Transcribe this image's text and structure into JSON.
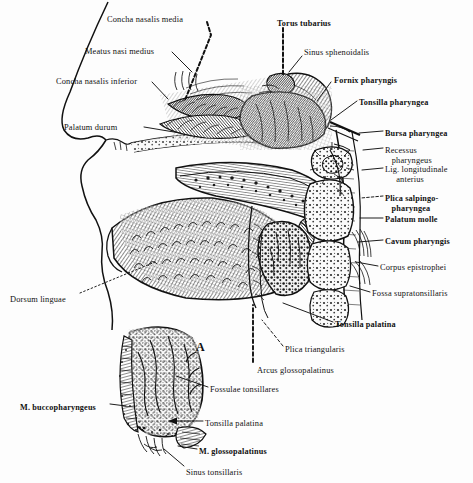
{
  "figure": {
    "background_color": "#fdfdfd",
    "ink_color": "#111111",
    "figure_letters": [
      {
        "text": "A",
        "x": 196,
        "y": 347
      }
    ]
  },
  "labels": [
    {
      "id": "concha-nasalis-media",
      "text": "Concha nasalis media",
      "x": 107,
      "y": 15,
      "bold": false
    },
    {
      "id": "torus-tubarius",
      "text": "Torus tubarius",
      "x": 277,
      "y": 19,
      "bold": true
    },
    {
      "id": "meatus-nasi-medius",
      "text": "Meatus nasi medius",
      "x": 85,
      "y": 47,
      "bold": false
    },
    {
      "id": "sinus-sphenoidalis",
      "text": "Sinus sphenoidalis",
      "x": 304,
      "y": 48,
      "bold": false
    },
    {
      "id": "concha-nasalis-inferior",
      "text": "Concha nasalis inferior",
      "x": 56,
      "y": 77,
      "bold": false
    },
    {
      "id": "fornix-pharyngis",
      "text": "Fornix pharyngis",
      "x": 334,
      "y": 76,
      "bold": true
    },
    {
      "id": "tonsilla-pharyngea",
      "text": "Tonsilla pharyngea",
      "x": 359,
      "y": 98,
      "bold": true
    },
    {
      "id": "palatum-durum",
      "text": "Palatum durum",
      "x": 64,
      "y": 123,
      "bold": false
    },
    {
      "id": "bursa-pharyngea",
      "text": "Bursa pharyngea",
      "x": 385,
      "y": 129,
      "bold": true
    },
    {
      "id": "recessus-pharyngeus",
      "text": "Recessus\n   pharyngeus",
      "x": 385,
      "y": 146,
      "bold": false
    },
    {
      "id": "lig-longitudinale",
      "text": "Lig. longitudinale\n     anterius",
      "x": 385,
      "y": 165,
      "bold": false
    },
    {
      "id": "plica-salpingopharyngea",
      "text": "Plica salpingo-\n   pharyngea",
      "x": 385,
      "y": 194,
      "bold": true
    },
    {
      "id": "palatum-molle",
      "text": "Palatum molle",
      "x": 385,
      "y": 215,
      "bold": true
    },
    {
      "id": "cavum-pharyngis",
      "text": "Cavum pharyngis",
      "x": 385,
      "y": 237,
      "bold": true
    },
    {
      "id": "corpus-epistrophei",
      "text": "Corpus epistrophei",
      "x": 380,
      "y": 263,
      "bold": false
    },
    {
      "id": "fossa-supratonsillaris",
      "text": "Fossa supratonsillaris",
      "x": 372,
      "y": 289,
      "bold": false
    },
    {
      "id": "dorsum-linguae",
      "text": "Dorsum linguae",
      "x": 10,
      "y": 295,
      "bold": false
    },
    {
      "id": "tonsilla-palatina-main",
      "text": "Tonsilla palatina",
      "x": 335,
      "y": 320,
      "bold": true
    },
    {
      "id": "plica-triangularis",
      "text": "Plica triangularis",
      "x": 285,
      "y": 345,
      "bold": false
    },
    {
      "id": "arcus-glossopalatinus",
      "text": "Arcus glossopalatinus",
      "x": 257,
      "y": 366,
      "bold": false
    },
    {
      "id": "fossulae-tonsillares",
      "text": "Fossulae tonsillares",
      "x": 210,
      "y": 385,
      "bold": false
    },
    {
      "id": "m-buccopharyngeus",
      "text": "M. buccopharyngeus",
      "x": 20,
      "y": 403,
      "bold": true
    },
    {
      "id": "tonsilla-palatina-inset",
      "text": "Tonsilla palatina",
      "x": 205,
      "y": 419,
      "bold": false
    },
    {
      "id": "m-glossopalatinus",
      "text": "M. glossopalatinus",
      "x": 199,
      "y": 447,
      "bold": true
    },
    {
      "id": "sinus-tonsillaris",
      "text": "Sinus tonsillaris",
      "x": 186,
      "y": 468,
      "bold": false
    }
  ],
  "leader_lines": [
    {
      "id": "leader-concha-media",
      "style": "dashed",
      "points": "207,22 211,35 185,100"
    },
    {
      "id": "leader-torus-tubarius",
      "style": "dashed",
      "points": "283,28 283,75"
    },
    {
      "id": "leader-meatus-nasi-medius",
      "style": "solid",
      "points": "172,52 192,72"
    },
    {
      "id": "leader-sinus-sphenoidalis",
      "style": "solid",
      "points": "302,56 289,72"
    },
    {
      "id": "leader-concha-inferior",
      "style": "solid",
      "points": "152,82 168,99"
    },
    {
      "id": "leader-fornix-pharyngis",
      "style": "solid",
      "points": "331,82 317,101"
    },
    {
      "id": "leader-tonsilla-pharyngea",
      "style": "solid",
      "points": "357,101 331,120"
    },
    {
      "id": "leader-palatum-durum",
      "style": "solid",
      "points": "144,127 180,133"
    },
    {
      "id": "leader-bursa-pharyngea",
      "style": "solid",
      "points": "383,131 359,133"
    },
    {
      "id": "leader-recessus",
      "style": "solid",
      "points": "383,148 363,150"
    },
    {
      "id": "leader-lig-longitudinale",
      "style": "solid",
      "points": "383,168 362,170"
    },
    {
      "id": "leader-plica-salpingo",
      "style": "dashed",
      "points": "383,196 361,198"
    },
    {
      "id": "leader-palatum-molle",
      "style": "solid",
      "points": "383,218 360,218"
    },
    {
      "id": "leader-cavum-pharyngis",
      "style": "solid",
      "points": "383,240 358,242"
    },
    {
      "id": "leader-corpus-epistrophei",
      "style": "solid",
      "points": "378,266 356,262"
    },
    {
      "id": "leader-fossa-supratons",
      "style": "solid",
      "points": "370,292 350,286"
    },
    {
      "id": "leader-dorsum-linguae",
      "style": "dotted",
      "points": "80,293 155,262"
    },
    {
      "id": "leader-tonsilla-pal-main",
      "style": "solid",
      "points": "333,322 283,303"
    },
    {
      "id": "leader-plica-triangularis",
      "style": "dashed",
      "points": "283,346 262,320"
    },
    {
      "id": "leader-arcus-glosso",
      "style": "dashed",
      "points": "253,362 253,305"
    },
    {
      "id": "leader-fossulae",
      "style": "solid",
      "points": "208,387 176,376"
    },
    {
      "id": "leader-m-buccopharyngeus",
      "style": "solid",
      "points": "110,404 126,406"
    },
    {
      "id": "leader-tonsilla-pal-inset",
      "style": "arrow",
      "points": "203,421 173,421"
    },
    {
      "id": "leader-m-glossopalatinus",
      "style": "solid",
      "points": "197,449 178,446"
    },
    {
      "id": "leader-sinus-tonsillaris",
      "style": "solid",
      "points": "184,466 164,449"
    }
  ]
}
